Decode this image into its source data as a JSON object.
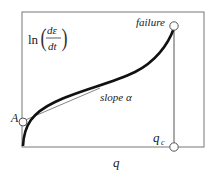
{
  "diagram": {
    "y_axis_label": {
      "prefix": "ln",
      "numerator": "dε",
      "denominator": "dt"
    },
    "x_axis_label": "q",
    "labels": {
      "failure": "failure",
      "slope": "slope α",
      "intercept": "A",
      "critical": "q",
      "critical_sub": "c"
    },
    "colors": {
      "frame": "#555555",
      "curve": "#111111",
      "tangent": "#555555"
    }
  }
}
